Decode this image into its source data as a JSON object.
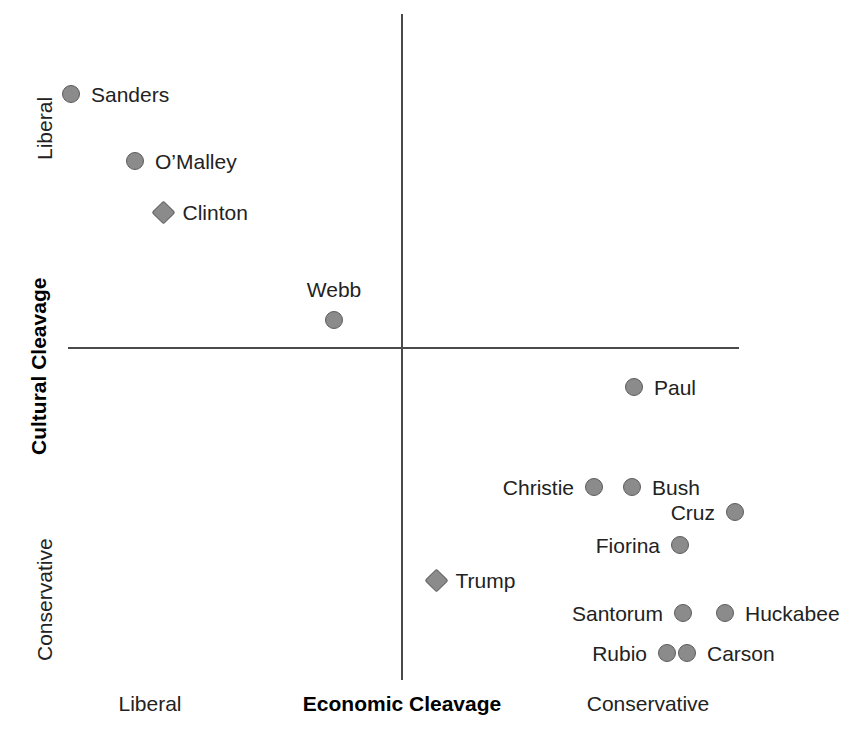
{
  "chart_data": {
    "type": "scatter",
    "title": "",
    "xlabel": "Economic Cleavage",
    "ylabel": "Cultural Cleavage",
    "xlim": [
      0,
      860
    ],
    "ylim": [
      0,
      739
    ],
    "grid": false,
    "legend": "none",
    "axis_origin": {
      "x": 402,
      "y": 348
    },
    "x_tick_labels": [
      {
        "text": "Liberal",
        "x": 150
      },
      {
        "text": "Conservative",
        "x": 648
      }
    ],
    "y_tick_labels": [
      {
        "text": "Liberal",
        "y": 122
      },
      {
        "text": "Conservative",
        "y": 588
      }
    ],
    "marker_color": "#8b8b8b",
    "marker_edge_color": "#5d5d5d",
    "axis_color": "#4a4a4a",
    "series": [
      {
        "name": "Democrats",
        "marker": "circle",
        "points": [
          {
            "label": "Sanders",
            "x": 71,
            "y": 94,
            "shape": "circle",
            "label_pos": "right"
          },
          {
            "label": "O’Malley",
            "x": 135,
            "y": 161,
            "shape": "circle",
            "label_pos": "right"
          },
          {
            "label": "Clinton",
            "x": 163,
            "y": 212,
            "shape": "diamond",
            "label_pos": "right"
          },
          {
            "label": "Webb",
            "x": 334,
            "y": 320,
            "shape": "circle",
            "label_pos": "above"
          }
        ]
      },
      {
        "name": "Republicans",
        "marker": "circle",
        "points": [
          {
            "label": "Paul",
            "x": 634,
            "y": 387,
            "shape": "circle",
            "label_pos": "right"
          },
          {
            "label": "Christie",
            "x": 594,
            "y": 487,
            "shape": "circle",
            "label_pos": "left"
          },
          {
            "label": "Bush",
            "x": 632,
            "y": 487,
            "shape": "circle",
            "label_pos": "right"
          },
          {
            "label": "Cruz",
            "x": 735,
            "y": 512,
            "shape": "circle",
            "label_pos": "left"
          },
          {
            "label": "Fiorina",
            "x": 680,
            "y": 545,
            "shape": "circle",
            "label_pos": "left"
          },
          {
            "label": "Trump",
            "x": 436,
            "y": 580,
            "shape": "diamond",
            "label_pos": "right"
          },
          {
            "label": "Santorum",
            "x": 683,
            "y": 613,
            "shape": "circle",
            "label_pos": "left"
          },
          {
            "label": "Huckabee",
            "x": 725,
            "y": 613,
            "shape": "circle",
            "label_pos": "right"
          },
          {
            "label": "Rubio",
            "x": 667,
            "y": 653,
            "shape": "circle",
            "label_pos": "left"
          },
          {
            "label": "Carson",
            "x": 687,
            "y": 653,
            "shape": "circle",
            "label_pos": "right"
          }
        ]
      }
    ]
  },
  "labels": {
    "sanders": "Sanders",
    "omalley": "O’Malley",
    "clinton": "Clinton",
    "webb": "Webb",
    "paul": "Paul",
    "christie": "Christie",
    "bush": "Bush",
    "cruz": "Cruz",
    "fiorina": "Fiorina",
    "trump": "Trump",
    "santorum": "Santorum",
    "huckabee": "Huckabee",
    "rubio": "Rubio",
    "carson": "Carson"
  },
  "axes": {
    "x_title": "Economic Cleavage",
    "y_title": "Cultural Cleavage",
    "x_left_tick": "Liberal",
    "x_right_tick": "Conservative",
    "y_top_tick": "Liberal",
    "y_bottom_tick": "Conservative"
  }
}
